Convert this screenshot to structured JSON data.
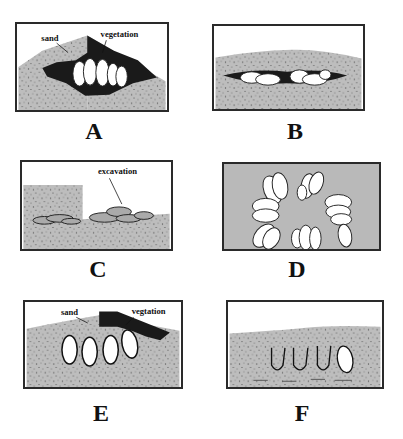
{
  "figure": {
    "colors": {
      "sand": "#b9b9b9",
      "sand_dark": "#a8a8a8",
      "vegetation": "#1a1a1a",
      "egg": "#ffffff",
      "outline": "#222222",
      "background": "#ffffff"
    },
    "panels": [
      {
        "id": "A",
        "label": "A",
        "annotations": [
          "sand",
          "vegetation"
        ]
      },
      {
        "id": "B",
        "label": "B",
        "annotations": []
      },
      {
        "id": "C",
        "label": "C",
        "annotations": [
          "excavation"
        ]
      },
      {
        "id": "D",
        "label": "D",
        "annotations": []
      },
      {
        "id": "E",
        "label": "E",
        "annotations": [
          "sand",
          "vegtation"
        ]
      },
      {
        "id": "F",
        "label": "F",
        "annotations": []
      }
    ]
  }
}
